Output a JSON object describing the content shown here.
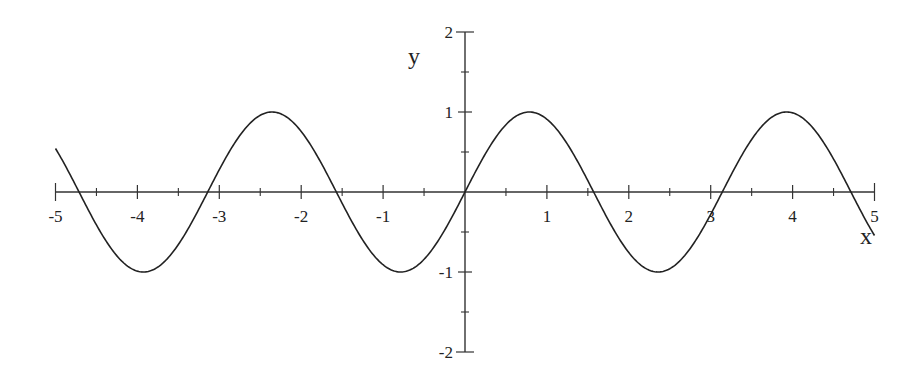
{
  "chart_data": {
    "type": "line",
    "title": "",
    "xlabel": "x",
    "ylabel": "y",
    "xlim": [
      -5,
      5
    ],
    "ylim": [
      -2,
      2
    ],
    "grid": false,
    "legend": null,
    "x_ticks": [
      -5,
      -4,
      -3,
      -2,
      -1,
      1,
      2,
      3,
      4,
      5
    ],
    "x_minor_ticks": [
      -4.5,
      -3.5,
      -2.5,
      -1.5,
      -0.5,
      0.5,
      1.5,
      2.5,
      3.5,
      4.5
    ],
    "y_ticks": [
      -2,
      -1,
      1,
      2
    ],
    "y_minor_ticks": [
      -1.5,
      -0.5,
      0.5,
      1.5
    ],
    "series": [
      {
        "name": "y = sin(2x)",
        "function": "sin(2x)",
        "x": [
          -5,
          -4.5,
          -3.93,
          -3.14,
          -2.36,
          -1.57,
          -0.79,
          0,
          0.79,
          1.57,
          2.36,
          3.14,
          3.93,
          4.71,
          5
        ],
        "y": [
          0.54,
          -0.41,
          -1,
          0,
          1,
          0,
          -1,
          0,
          1,
          0,
          -1,
          0,
          1,
          0,
          -0.54
        ],
        "color": "#222222"
      }
    ]
  },
  "axes": {
    "x_label": "x",
    "y_label": "y",
    "x_tick_labels": [
      "-5",
      "-4",
      "-3",
      "-2",
      "-1",
      "1",
      "2",
      "3",
      "4",
      "5"
    ],
    "y_tick_labels": [
      "2",
      "1",
      "-1",
      "-2"
    ]
  }
}
